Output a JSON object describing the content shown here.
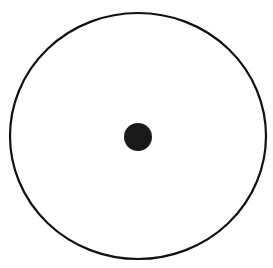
{
  "diagram": {
    "canvas": {
      "width": 273,
      "height": 268,
      "background": "#ffffff"
    },
    "outer_circle": {
      "cx": 138,
      "cy": 136,
      "rx": 128,
      "ry": 123,
      "stroke": "#111111",
      "stroke_width": 2.2,
      "fill": "none"
    },
    "center_dot": {
      "cx": 138,
      "cy": 137,
      "r": 14,
      "fill": "#1a1a1a"
    }
  }
}
